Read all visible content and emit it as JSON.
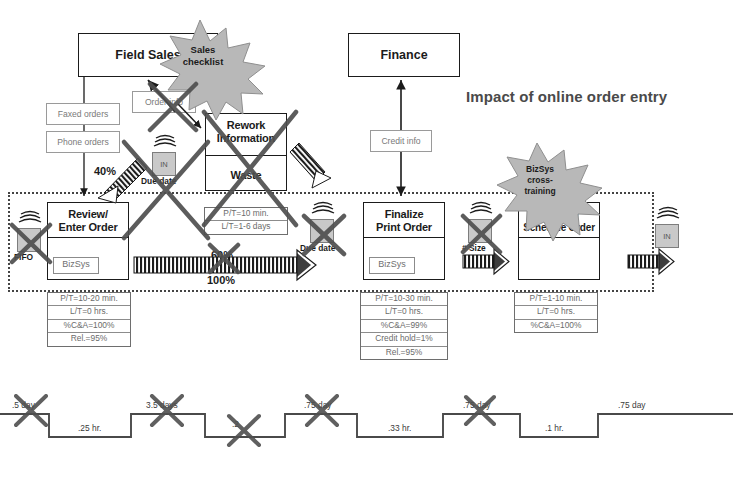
{
  "title": "Impact of online order entry",
  "colors": {
    "ink": "#1b1b1b",
    "grey_text": "#6f6f6f",
    "burst_fill": "#b7b7b7",
    "inventory_fill": "#c9c9c9",
    "cross_out": "#555555",
    "boundary": "#444444"
  },
  "departments": [
    {
      "name": "field-sales",
      "label": "Field Sales"
    },
    {
      "name": "finance",
      "label": "Finance"
    }
  ],
  "information_boxes": [
    {
      "name": "faxed-orders",
      "label": "Faxed orders",
      "crossed_out": false
    },
    {
      "name": "phone-orders",
      "label": "Phone orders",
      "crossed_out": false
    },
    {
      "name": "order-info",
      "label": "Order info",
      "crossed_out": true
    },
    {
      "name": "credit-info",
      "label": "Credit info",
      "crossed_out": false
    }
  ],
  "kaizen_bursts": [
    {
      "name": "sales-checklist",
      "label": "Sales\nchecklist",
      "lines": [
        "Sales",
        "checklist"
      ]
    },
    {
      "name": "bizsys-cross-training",
      "label": "BizSys cross-training",
      "lines": [
        "BizSys",
        "cross-",
        "training"
      ]
    }
  ],
  "processes": [
    {
      "name": "review-enter-order",
      "title_lines": [
        "Review/",
        "Enter Order"
      ],
      "system": "BizSys",
      "crossed_out": false,
      "data": [
        "P/T=10-20 min.",
        "L/T=0 hrs.",
        "%C&A=100%",
        "Rel.=95%"
      ]
    },
    {
      "name": "rework-information-waste",
      "title_lines": [
        "Rework",
        "Information"
      ],
      "second_label": "Waste",
      "system": "",
      "crossed_out": true,
      "data": [
        "P/T=10 min.",
        "L/T=1-6 days"
      ]
    },
    {
      "name": "finalize-print-order",
      "title_lines": [
        "Finalize",
        "Print Order"
      ],
      "system": "BizSys",
      "crossed_out": false,
      "data": [
        "P/T=10-30 min.",
        "L/T=0 hrs.",
        "%C&A=99%",
        "Credit hold=1%",
        "Rel.=95%"
      ]
    },
    {
      "name": "review-schedule-order",
      "title_lines": [
        "Review/",
        "Schedule Order"
      ],
      "system": "",
      "crossed_out": false,
      "data": [
        "P/T=1-10 min.",
        "L/T=0 hrs.",
        "%C&A=100%"
      ]
    }
  ],
  "inventory_markers": [
    {
      "name": "fifo-marker",
      "label": "FIFO",
      "box_text": "",
      "crossed_out": true
    },
    {
      "name": "due-date-marker-1",
      "label": "Due date",
      "box_text": "IN",
      "crossed_out": true
    },
    {
      "name": "due-date-marker-2",
      "label": "Due date",
      "box_text": "",
      "crossed_out": true
    },
    {
      "name": "batch-size-marker",
      "label": "# Size",
      "box_text": "",
      "crossed_out": true
    },
    {
      "name": "in-marker-final",
      "label": "",
      "box_text": "IN",
      "crossed_out": false
    }
  ],
  "flow_percentages": [
    {
      "name": "pct-40",
      "value": "40%",
      "crossed_out": false
    },
    {
      "name": "pct-60",
      "value": "60%",
      "crossed_out": true
    },
    {
      "name": "pct-100",
      "value": "100%",
      "crossed_out": false
    }
  ],
  "timeline": {
    "name": "value-stream-timeline",
    "lead_times": [
      {
        "label": ".5 day",
        "crossed_out": true
      },
      {
        "label": "3.5 days",
        "crossed_out": true
      },
      {
        "label": ".2",
        "crossed_out": true
      },
      {
        "label": ".75 day",
        "crossed_out": true
      },
      {
        "label": ".75 day",
        "crossed_out": true
      },
      {
        "label": ".75 day",
        "crossed_out": false
      }
    ],
    "process_times": [
      {
        "label": ".25 hr."
      },
      {
        "label": ".33 hr."
      },
      {
        "label": ".1 hr."
      }
    ]
  }
}
